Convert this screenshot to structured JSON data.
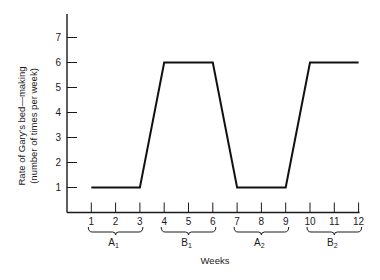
{
  "chart_data": {
    "type": "line",
    "title": "",
    "xlabel": "Weeks",
    "ylabel_line1": "Rate of Gary's bed—making",
    "ylabel_line2": "(number of times per week)",
    "x": [
      1,
      2,
      3,
      4,
      5,
      6,
      7,
      8,
      9,
      10,
      11,
      12
    ],
    "values": [
      1,
      1,
      1,
      6,
      6,
      6,
      1,
      1,
      1,
      6,
      6,
      6
    ],
    "x_ticks": [
      "1",
      "2",
      "3",
      "4",
      "5",
      "6",
      "7",
      "8",
      "9",
      "10",
      "11",
      "12"
    ],
    "y_ticks": [
      "1",
      "2",
      "3",
      "4",
      "5",
      "6",
      "7"
    ],
    "ylim": [
      0,
      8
    ],
    "xlim": [
      0,
      12
    ],
    "grid": false,
    "legend": null,
    "phases": [
      {
        "label": "A",
        "sub": "1",
        "start": 1,
        "end": 3
      },
      {
        "label": "B",
        "sub": "1",
        "start": 4,
        "end": 6
      },
      {
        "label": "A",
        "sub": "2",
        "start": 7,
        "end": 9
      },
      {
        "label": "B",
        "sub": "2",
        "start": 10,
        "end": 12
      }
    ],
    "line_color": "#111111"
  }
}
